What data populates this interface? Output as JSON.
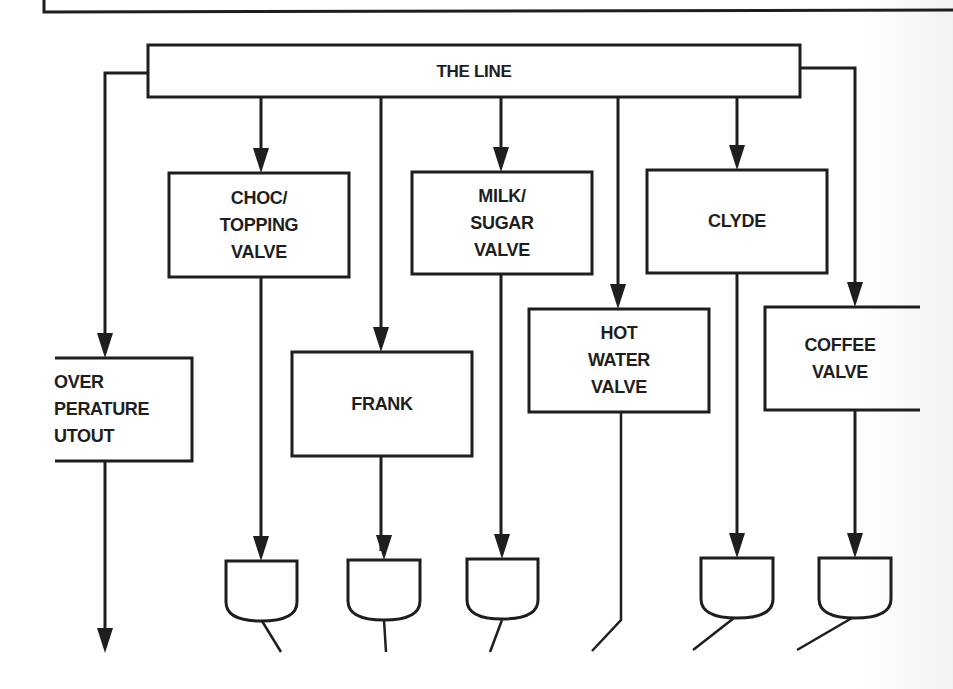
{
  "diagram": {
    "title_bar": {
      "label": "THE LINE"
    },
    "nodes": {
      "over_temperature_cutout": {
        "label": "OVER\nPERATURE\nUTOUT",
        "note": "cropped at left edge"
      },
      "choc_topping_valve": {
        "label": "CHOC/\nTOPPING\nVALVE"
      },
      "frank": {
        "label": "FRANK"
      },
      "milk_sugar_valve": {
        "label": "MILK/\nSUGAR\nVALVE"
      },
      "hot_water_valve": {
        "label": "HOT\nWATER\nVALVE"
      },
      "clyde": {
        "label": "CLYDE"
      },
      "coffee_valve": {
        "label": "COFFEE\nVALVE",
        "note": "cropped at right edge"
      }
    },
    "mixing_bowls": [
      "choc-topping-bowl",
      "frank-bowl",
      "milk-sugar-bowl",
      "clyde-bowl",
      "coffee-bowl"
    ],
    "colors": {
      "stroke": "#1e1e1e",
      "background": "#ffffff"
    }
  }
}
